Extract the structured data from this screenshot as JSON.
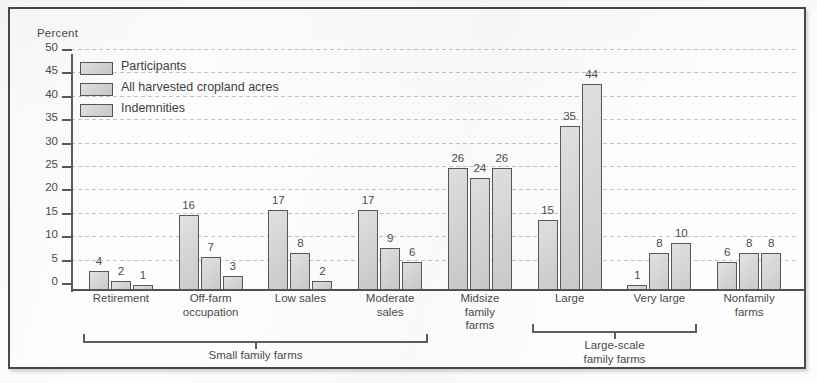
{
  "chart_data": {
    "type": "bar",
    "title": "",
    "ylabel": "Percent",
    "xlabel": "",
    "ylim": [
      0,
      50
    ],
    "yticks": [
      0,
      5,
      10,
      15,
      20,
      25,
      30,
      35,
      40,
      45,
      50
    ],
    "grid": true,
    "legend_position": "top-left",
    "categories": [
      "Retirement",
      "Off-farm occupation",
      "Low sales",
      "Moderate sales",
      "Midsize family farms",
      "Large",
      "Very large",
      "Nonfamily farms"
    ],
    "category_lines": [
      [
        "Retirement"
      ],
      [
        "Off-farm",
        "occupation"
      ],
      [
        "Low sales"
      ],
      [
        "Moderate",
        "sales"
      ],
      [
        "Midsize",
        "family",
        "farms"
      ],
      [
        "Large"
      ],
      [
        "Very large"
      ],
      [
        "Nonfamily",
        "farms"
      ]
    ],
    "series": [
      {
        "name": "Participants",
        "values": [
          4,
          16,
          17,
          17,
          26,
          15,
          1,
          6
        ]
      },
      {
        "name": "All harvested cropland acres",
        "values": [
          2,
          7,
          8,
          9,
          24,
          35,
          8,
          8
        ]
      },
      {
        "name": "Indemnities",
        "values": [
          1,
          3,
          2,
          6,
          26,
          44,
          10,
          8
        ]
      }
    ],
    "group_brackets": [
      {
        "label_lines": [
          "Small family farms"
        ],
        "from_category": 0,
        "to_category": 3
      },
      {
        "label_lines": [
          "Large-scale",
          "family farms"
        ],
        "from_category": 5,
        "to_category": 6
      }
    ],
    "colors": {
      "bar_fill": "#d2d2d2",
      "bar_stroke": "#585858",
      "axis": "#4f4f4f",
      "text": "#4b4b4b",
      "gridline": "#969696",
      "frame": "#4a4a4a",
      "background": "#fefefe"
    }
  }
}
